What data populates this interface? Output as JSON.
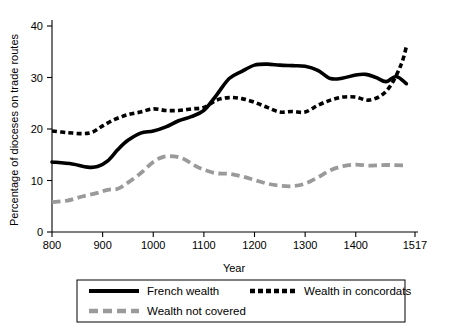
{
  "chart_data": {
    "type": "line",
    "title": "",
    "xlabel": "Year",
    "ylabel": "Percentage of dioceses on trade routes",
    "xlim": [
      800,
      1517
    ],
    "ylim": [
      0,
      40
    ],
    "grid": false,
    "legend_position": "bottom",
    "xticks": [
      800,
      900,
      1000,
      1100,
      1200,
      1300,
      1400,
      1517
    ],
    "xtick_labels": [
      "800",
      "900",
      "1000",
      "1100",
      "1200",
      "1300",
      "1400",
      "1517"
    ],
    "yticks": [
      0,
      10,
      20,
      30,
      40
    ],
    "ytick_labels": [
      "0",
      "10",
      "20",
      "30",
      "40"
    ],
    "series": [
      {
        "name": "French wealth",
        "style": "solid",
        "color": "#000000",
        "x": [
          800,
          840,
          870,
          890,
          910,
          930,
          950,
          975,
          1000,
          1025,
          1050,
          1075,
          1100,
          1125,
          1150,
          1175,
          1200,
          1225,
          1250,
          1275,
          1300,
          1325,
          1350,
          1375,
          1400,
          1420,
          1440,
          1460,
          1480,
          1500
        ],
        "values": [
          13.6,
          13.2,
          12.6,
          12.7,
          13.8,
          16.0,
          17.8,
          19.2,
          19.6,
          20.4,
          21.6,
          22.4,
          23.6,
          26.6,
          29.8,
          31.2,
          32.4,
          32.6,
          32.4,
          32.3,
          32.2,
          31.4,
          29.8,
          29.9,
          30.5,
          30.6,
          30.0,
          29.2,
          30.2,
          28.8
        ]
      },
      {
        "name": "Wealth in concordats",
        "style": "dotted",
        "color": "#000000",
        "x": [
          800,
          830,
          860,
          880,
          900,
          925,
          950,
          975,
          1000,
          1025,
          1050,
          1075,
          1100,
          1125,
          1150,
          1175,
          1200,
          1225,
          1250,
          1275,
          1300,
          1325,
          1350,
          1375,
          1400,
          1425,
          1450,
          1470,
          1490,
          1500
        ],
        "values": [
          19.6,
          19.3,
          19.1,
          19.4,
          20.6,
          21.9,
          22.8,
          23.3,
          23.9,
          23.6,
          23.6,
          23.9,
          24.2,
          25.6,
          26.1,
          25.9,
          25.2,
          24.2,
          23.3,
          23.4,
          23.3,
          24.6,
          25.6,
          26.2,
          26.2,
          25.6,
          26.5,
          28.6,
          32.6,
          36.0
        ]
      },
      {
        "name": "Wealth not covered",
        "style": "dashed",
        "color": "#9a9a9a",
        "x": [
          800,
          830,
          860,
          890,
          910,
          930,
          950,
          975,
          1000,
          1020,
          1040,
          1060,
          1080,
          1100,
          1125,
          1150,
          1175,
          1200,
          1225,
          1250,
          1275,
          1300,
          1325,
          1350,
          1375,
          1400,
          1425,
          1450,
          1475,
          1500
        ],
        "values": [
          5.8,
          6.1,
          6.9,
          7.6,
          8.2,
          8.4,
          9.6,
          11.4,
          13.6,
          14.6,
          14.7,
          14.2,
          13.0,
          12.1,
          11.4,
          11.3,
          10.8,
          10.1,
          9.4,
          9.0,
          8.9,
          9.4,
          10.6,
          12.0,
          12.8,
          13.1,
          12.9,
          13.0,
          13.0,
          12.9
        ]
      }
    ],
    "legend": [
      {
        "label": "French wealth",
        "style": "solid",
        "color": "#000000"
      },
      {
        "label": "Wealth in concordats",
        "style": "dotted",
        "color": "#000000"
      },
      {
        "label": "Wealth not covered",
        "style": "dashed",
        "color": "#9a9a9a"
      }
    ]
  }
}
